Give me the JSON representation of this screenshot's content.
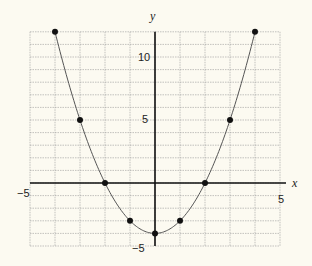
{
  "chart_data": {
    "type": "line",
    "title": "",
    "xlabel": "x",
    "ylabel": "y",
    "xlim": [
      -5,
      5
    ],
    "ylim": [
      -5,
      12
    ],
    "grid": true,
    "function": "y = x^2 - 4",
    "x": [
      -4,
      -3,
      -2,
      -1,
      0,
      1,
      2,
      3,
      4
    ],
    "series": [
      {
        "name": "y = x^2 - 4",
        "values": [
          12,
          5,
          0,
          -3,
          -4,
          -3,
          0,
          5,
          12
        ]
      }
    ],
    "x_tick_labels": [
      "-5",
      "5"
    ],
    "y_tick_labels": [
      "10",
      "5",
      "-5"
    ]
  },
  "labels": {
    "x_axis": "x",
    "y_axis": "y",
    "x_min": "−5",
    "x_max": "5",
    "y_10": "10",
    "y_5": "5",
    "y_min": "−5"
  },
  "colors": {
    "background": "#fcfaf1",
    "grid": "#9a9a9a",
    "axis": "#111111",
    "curve": "#555555",
    "point": "#111111"
  }
}
